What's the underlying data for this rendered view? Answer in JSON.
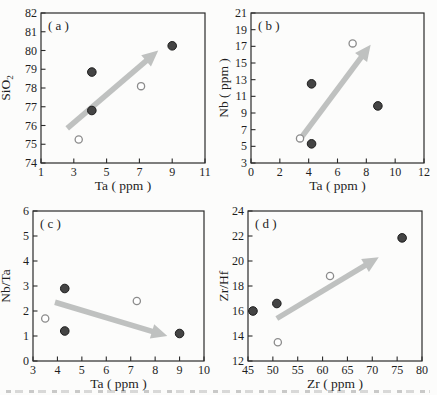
{
  "figure": {
    "grid": "2x2",
    "tick_direction": "in",
    "gridlines": false,
    "legend": null
  },
  "colors": {
    "background": "#fcfcfb",
    "frame": "#2a2a2a",
    "text": "#1e1e1e",
    "filled_point_fill": "#444444",
    "filled_point_edge": "#1c1c1c",
    "open_point_fill": "#ffffff",
    "open_point_edge": "#8c8c8c",
    "arrow": "#bfc1c0"
  },
  "chart_data": [
    {
      "type": "scatter",
      "panel_label": "( a )",
      "xlabel": "Ta ( ppm )",
      "ylabel": "SiO₂",
      "xlim": [
        1,
        11
      ],
      "ylim": [
        74,
        82
      ],
      "xticks": [
        1,
        3,
        5,
        7,
        9,
        11
      ],
      "yticks": [
        74,
        75,
        76,
        77,
        78,
        79,
        80,
        81,
        82
      ],
      "series": [
        {
          "name": "filled-circles",
          "marker": "filled",
          "points": [
            [
              4.1,
              78.85
            ],
            [
              4.1,
              76.8
            ],
            [
              9.0,
              80.25
            ]
          ]
        },
        {
          "name": "open-circles",
          "marker": "open",
          "points": [
            [
              3.3,
              75.25
            ],
            [
              7.1,
              78.1
            ]
          ]
        }
      ],
      "trend_arrow": {
        "from": [
          2.6,
          75.85
        ],
        "to": [
          8.15,
          80.0
        ]
      }
    },
    {
      "type": "scatter",
      "panel_label": "( b )",
      "xlabel": "Ta ( ppm )",
      "ylabel": "Nb ( ppm )",
      "xlim": [
        0,
        12
      ],
      "ylim": [
        3,
        21
      ],
      "xticks": [
        0,
        2,
        4,
        6,
        8,
        10,
        12
      ],
      "yticks": [
        3,
        5,
        7,
        9,
        11,
        13,
        15,
        17,
        19,
        21
      ],
      "series": [
        {
          "name": "filled-circles",
          "marker": "filled",
          "points": [
            [
              4.2,
              12.5
            ],
            [
              4.2,
              5.3
            ],
            [
              8.8,
              9.85
            ]
          ]
        },
        {
          "name": "open-circles",
          "marker": "open",
          "points": [
            [
              3.4,
              5.95
            ],
            [
              7.05,
              17.35
            ]
          ]
        }
      ],
      "trend_arrow": {
        "from": [
          3.55,
          6.2
        ],
        "to": [
          8.3,
          17.2
        ]
      }
    },
    {
      "type": "scatter",
      "panel_label": "( c )",
      "xlabel": "Ta ( ppm )",
      "ylabel": "Nb/Ta",
      "xlim": [
        3,
        10
      ],
      "ylim": [
        0,
        6
      ],
      "xticks": [
        3,
        4,
        5,
        6,
        7,
        8,
        9,
        10
      ],
      "yticks": [
        0,
        1,
        2,
        3,
        4,
        5,
        6
      ],
      "series": [
        {
          "name": "filled-circles",
          "marker": "filled",
          "points": [
            [
              4.3,
              2.9
            ],
            [
              4.3,
              1.2
            ],
            [
              9.0,
              1.1
            ]
          ]
        },
        {
          "name": "open-circles",
          "marker": "open",
          "points": [
            [
              3.5,
              1.7
            ],
            [
              7.25,
              2.4
            ]
          ]
        }
      ],
      "trend_arrow": {
        "from": [
          3.9,
          2.35
        ],
        "to": [
          8.5,
          1.0
        ]
      }
    },
    {
      "type": "scatter",
      "panel_label": "( d )",
      "xlabel": "Zr ( ppm )",
      "ylabel": "Zr/Hf",
      "xlim": [
        45,
        80
      ],
      "ylim": [
        12,
        24
      ],
      "xticks": [
        45,
        50,
        55,
        60,
        65,
        70,
        75,
        80
      ],
      "yticks": [
        12,
        14,
        16,
        18,
        20,
        22,
        24
      ],
      "series": [
        {
          "name": "filled-circles",
          "marker": "filled",
          "points": [
            [
              46,
              16.0
            ],
            [
              50.8,
              16.6
            ],
            [
              76,
              21.85
            ]
          ]
        },
        {
          "name": "open-circles",
          "marker": "open",
          "points": [
            [
              51,
              13.5
            ],
            [
              61.5,
              18.8
            ]
          ]
        }
      ],
      "trend_arrow": {
        "from": [
          50.8,
          15.4
        ],
        "to": [
          71.3,
          20.3
        ]
      }
    }
  ]
}
